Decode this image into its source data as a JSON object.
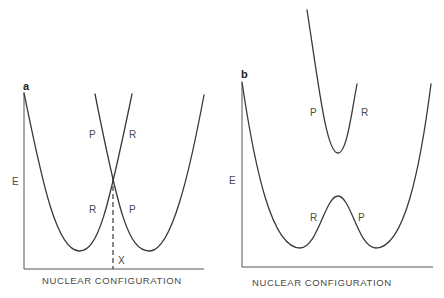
{
  "figure": {
    "panel_a": {
      "label": "a",
      "y_axis_label": "E",
      "x_axis_label": "NUCLEAR CONFIGURATION",
      "curve_labels": {
        "upper_left": "P",
        "upper_right": "R",
        "lower_left": "R",
        "lower_right": "P"
      },
      "crossing_marker": "X"
    },
    "panel_b": {
      "label": "b",
      "y_axis_label": "E",
      "x_axis_label": "NUCLEAR CONFIGURATION",
      "upper_surface_labels": {
        "left": "P",
        "right": "R"
      },
      "lower_surface_labels": {
        "left": "R",
        "right": "P"
      }
    },
    "colors": {
      "line": "#3a3a3a",
      "text": "#4a4a4a",
      "background": "#ffffff"
    }
  }
}
